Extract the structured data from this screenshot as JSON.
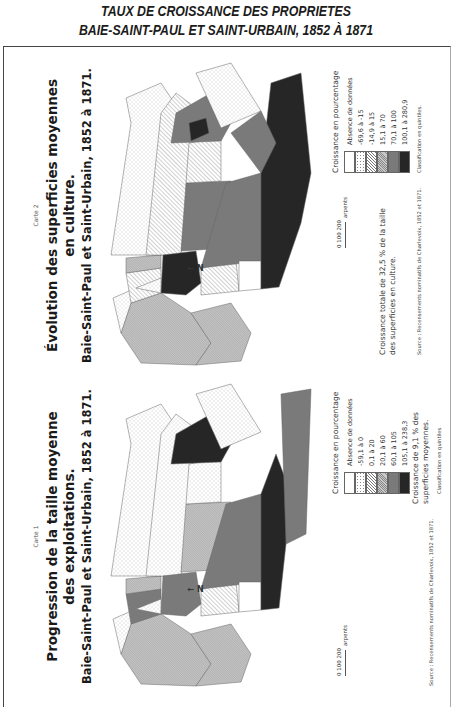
{
  "document": {
    "title_line1": "TAUX DE CROISSANCE DES PROPRIETES",
    "title_line2": "BAIE-SAINT-PAUL ET SAINT-URBAIN, 1852 À 1871"
  },
  "maps": [
    {
      "carte_label": "Carte 1",
      "title_line1": "Progression de la taille moyenne",
      "title_line2": "des exploitations.",
      "subtitle": "Baie-Saint-Paul et Saint-Urbain, 1852 à 1871.",
      "north_label": "N",
      "scale": {
        "ticks": "0  100  200",
        "unit": "arpents"
      },
      "legend": {
        "title": "Croissance en pourcentage",
        "items": [
          {
            "label": "Absence de données",
            "pattern": "none"
          },
          {
            "label": "-59,1 à 0",
            "pattern": "dots"
          },
          {
            "label": "0,1 à 20",
            "pattern": "hatch"
          },
          {
            "label": "20,1 à 60",
            "pattern": "fine-hatch"
          },
          {
            "label": "60,1 à 105",
            "pattern": "medium-gray"
          },
          {
            "label": "105,1 à 238,3",
            "pattern": "dark"
          }
        ]
      },
      "note": "Croissance de 9,1 % des superficies moyennes.",
      "source": "Source : Recensements nominatifs de Charlevoix, 1852 et 1871.",
      "classification": "Classification en quintiles"
    },
    {
      "carte_label": "Carte 2",
      "title_line1": "Évolution des superficies moyennes",
      "title_line2": "en culture.",
      "subtitle": "Baie-Saint-Paul et Saint-Urbain, 1852 à 1871.",
      "north_label": "N",
      "scale": {
        "ticks": "0  100  200",
        "unit": "arpents"
      },
      "legend": {
        "title": "Croissance en pourcentage",
        "items": [
          {
            "label": "Absence de données",
            "pattern": "none"
          },
          {
            "label": "-69,6 à -15",
            "pattern": "dots"
          },
          {
            "label": "-14,9 à 15",
            "pattern": "hatch"
          },
          {
            "label": "15,1 à 70",
            "pattern": "fine-hatch"
          },
          {
            "label": "70,1 à 100",
            "pattern": "medium-gray"
          },
          {
            "label": "100,1 à 280,9",
            "pattern": "dark"
          }
        ]
      },
      "note": "Croissance totale de 32,5 % de la taille des superficies en culture.",
      "source": "Source : Recensements nominatifs de Charlevoix, 1852 et 1871.",
      "classification": "Classification en quintiles."
    }
  ],
  "colors": {
    "dark": "#262626",
    "medium_gray": "#7a7a7a",
    "light_gray": "#bdbdbd",
    "outline": "#666666"
  }
}
